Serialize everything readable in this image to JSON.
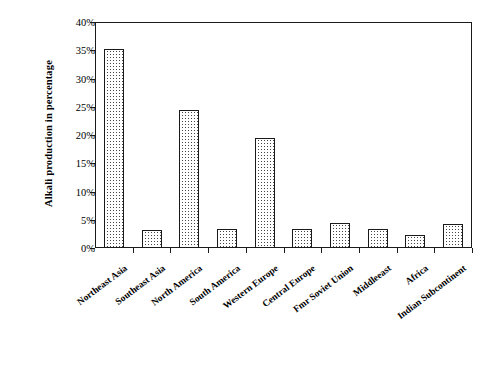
{
  "chart_data": {
    "type": "bar",
    "title": "",
    "subtitle": "",
    "xlabel": "",
    "ylabel": "Alkali production in percentage",
    "categories": [
      "Northeast Asia",
      "Southeast Asia",
      "North America",
      "South America",
      "Western Europe",
      "Central Europe",
      "Fmr Soviet Union",
      "Middleeast",
      "Africa",
      "Indian Subcontinent"
    ],
    "values": [
      35.2,
      3.2,
      24.4,
      3.3,
      19.5,
      3.3,
      4.4,
      3.4,
      2.3,
      4.3
    ],
    "ylim": [
      0,
      40
    ],
    "ytick_values": [
      0,
      5,
      10,
      15,
      20,
      25,
      30,
      35,
      40
    ],
    "ytick_labels": [
      "0%",
      "5%",
      "10%",
      "15%",
      "20%",
      "25%",
      "30%",
      "35%",
      "40%"
    ],
    "grid": false,
    "legend": false,
    "legend_position": "none",
    "bar_fill": "stipple-dot-pattern",
    "bar_edge_color": "#1a1a1a",
    "background_color": "#ffffff",
    "axis_color": "#1a1a1a",
    "label_rotation_degrees": -37
  }
}
